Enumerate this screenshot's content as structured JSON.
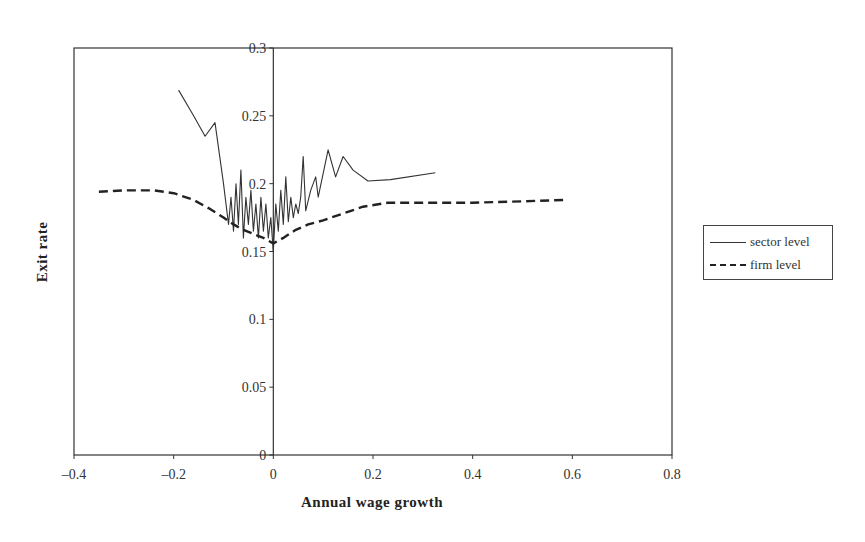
{
  "chart_data": {
    "type": "line",
    "title": "",
    "xlabel": "Annual wage growth",
    "ylabel": "Exit rate",
    "xlim": [
      -0.4,
      0.8
    ],
    "ylim": [
      0,
      0.3
    ],
    "x_ticks": [
      "-0.4",
      "-0.2",
      "0",
      "0.2",
      "0.4",
      "0.6",
      "0.8"
    ],
    "y_ticks": [
      "0",
      "0.05",
      "0.1",
      "0.15",
      "0.2",
      "0.25",
      "0.3"
    ],
    "grid": false,
    "legend_position": "right",
    "series": [
      {
        "name": "sector level",
        "style": "solid",
        "color": "#333333",
        "points": [
          [
            -0.19,
            0.269
          ],
          [
            -0.16,
            0.25
          ],
          [
            -0.137,
            0.235
          ],
          [
            -0.117,
            0.245
          ],
          [
            -0.1,
            0.2
          ],
          [
            -0.09,
            0.17
          ],
          [
            -0.085,
            0.19
          ],
          [
            -0.08,
            0.165
          ],
          [
            -0.075,
            0.2
          ],
          [
            -0.07,
            0.17
          ],
          [
            -0.065,
            0.21
          ],
          [
            -0.06,
            0.16
          ],
          [
            -0.055,
            0.19
          ],
          [
            -0.05,
            0.17
          ],
          [
            -0.045,
            0.195
          ],
          [
            -0.04,
            0.165
          ],
          [
            -0.035,
            0.185
          ],
          [
            -0.03,
            0.16
          ],
          [
            -0.025,
            0.19
          ],
          [
            -0.02,
            0.165
          ],
          [
            -0.015,
            0.185
          ],
          [
            -0.01,
            0.16
          ],
          [
            -0.005,
            0.175
          ],
          [
            0.0,
            0.15
          ],
          [
            0.005,
            0.185
          ],
          [
            0.01,
            0.165
          ],
          [
            0.015,
            0.195
          ],
          [
            0.02,
            0.17
          ],
          [
            0.025,
            0.205
          ],
          [
            0.03,
            0.172
          ],
          [
            0.035,
            0.19
          ],
          [
            0.04,
            0.175
          ],
          [
            0.045,
            0.185
          ],
          [
            0.05,
            0.178
          ],
          [
            0.055,
            0.19
          ],
          [
            0.06,
            0.22
          ],
          [
            0.065,
            0.18
          ],
          [
            0.075,
            0.195
          ],
          [
            0.085,
            0.205
          ],
          [
            0.09,
            0.19
          ],
          [
            0.11,
            0.225
          ],
          [
            0.125,
            0.205
          ],
          [
            0.14,
            0.22
          ],
          [
            0.16,
            0.21
          ],
          [
            0.19,
            0.202
          ],
          [
            0.235,
            0.203
          ],
          [
            0.325,
            0.208
          ]
        ]
      },
      {
        "name": "firm level",
        "style": "dashed",
        "color": "#222222",
        "points": [
          [
            -0.35,
            0.194
          ],
          [
            -0.3,
            0.195
          ],
          [
            -0.24,
            0.195
          ],
          [
            -0.2,
            0.193
          ],
          [
            -0.16,
            0.188
          ],
          [
            -0.13,
            0.182
          ],
          [
            -0.1,
            0.175
          ],
          [
            -0.08,
            0.17
          ],
          [
            -0.06,
            0.166
          ],
          [
            -0.04,
            0.163
          ],
          [
            -0.02,
            0.16
          ],
          [
            0.0,
            0.156
          ],
          [
            0.02,
            0.16
          ],
          [
            0.045,
            0.166
          ],
          [
            0.07,
            0.17
          ],
          [
            0.1,
            0.173
          ],
          [
            0.14,
            0.178
          ],
          [
            0.18,
            0.183
          ],
          [
            0.23,
            0.186
          ],
          [
            0.3,
            0.186
          ],
          [
            0.4,
            0.186
          ],
          [
            0.5,
            0.187
          ],
          [
            0.59,
            0.188
          ]
        ]
      }
    ]
  },
  "legend": {
    "items": [
      {
        "label": "sector level",
        "style": "solid"
      },
      {
        "label": "firm level",
        "style": "dashed"
      }
    ]
  }
}
